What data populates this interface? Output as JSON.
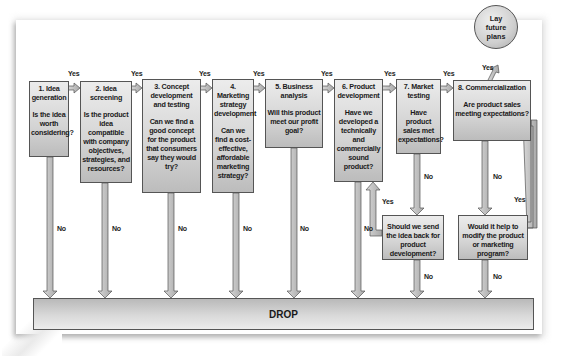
{
  "stages": [
    {
      "title": "1. Idea generation",
      "question": "Is the idea worth considering?"
    },
    {
      "title": "2. Idea screening",
      "question": "Is the product idea compatible with company objectives, strategies, and resources?"
    },
    {
      "title": "3. Concept development and testing",
      "question": "Can we find a good concept for the product that consumers say they would try?"
    },
    {
      "title": "4. Marketing strategy development",
      "question": "Can we find a cost-effective, affordable marketing strategy?"
    },
    {
      "title": "5. Business analysis",
      "question": "Will this product meet our profit goal?"
    },
    {
      "title": "6. Product development",
      "question": "Have we developed a technically and commercially sound product?"
    },
    {
      "title": "7. Market testing",
      "question": "Have product sales met expectations?"
    },
    {
      "title": "8. Commercialization",
      "question": "Are product sales meeting expectations?"
    }
  ],
  "decisions": [
    {
      "question": "Should we send the idea back for product development?"
    },
    {
      "question": "Would it help to modify the product or marketing program?"
    }
  ],
  "terminal": {
    "drop": "DROP",
    "future": "Lay future plans"
  },
  "labels": {
    "yes": "Yes",
    "no": "No"
  },
  "colors": {
    "box_light": "#ececec",
    "box_dark": "#bcbcbc",
    "arrow_fill": "#bdbdbd",
    "outline": "#555555"
  }
}
